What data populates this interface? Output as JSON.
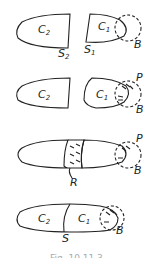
{
  "figure": {
    "panels": [
      {
        "id": "stage-1",
        "labels": {
          "c2": "C",
          "c2_sub": "2",
          "c1": "C",
          "c1_sub": "1",
          "s2": "S",
          "s2_sub": "2",
          "s1": "S",
          "s1_sub": "1",
          "b": "B"
        }
      },
      {
        "id": "stage-2",
        "labels": {
          "c2": "C",
          "c2_sub": "2",
          "c1": "C",
          "c1_sub": "1",
          "p": "P",
          "b": "B"
        }
      },
      {
        "id": "stage-3",
        "labels": {
          "p": "P",
          "b": "B",
          "r": "R"
        }
      },
      {
        "id": "stage-4",
        "labels": {
          "c2": "C",
          "c2_sub": "2",
          "c1": "C",
          "c1_sub": "1",
          "s": "S",
          "b": "B"
        }
      }
    ],
    "caption": "Fig. 10.11.3"
  },
  "colors": {
    "stroke": "#222222",
    "background": "#ffffff"
  }
}
